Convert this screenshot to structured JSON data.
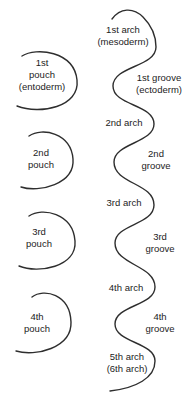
{
  "diagram": {
    "title_semantic": "Pharyngeal pouches, arches and grooves schematic",
    "background_color": "#ffffff",
    "stroke_color": "#2e2e2e",
    "text_color": "#1c1c1c",
    "pouches": [
      {
        "label": "1st\npouch\n(entoderm)"
      },
      {
        "label": "2nd\npouch"
      },
      {
        "label": "3rd\npouch"
      },
      {
        "label": "4th\npouch"
      }
    ],
    "arches": [
      {
        "label": "1st arch\n(mesoderm)"
      },
      {
        "label": "2nd arch"
      },
      {
        "label": "3rd arch"
      },
      {
        "label": "4th arch"
      },
      {
        "label": "5th arch\n(6th arch)"
      }
    ],
    "grooves": [
      {
        "label": "1st groove\n(ectoderm)"
      },
      {
        "label": "2nd groove"
      },
      {
        "label": "3rd groove"
      },
      {
        "label": "4th groove"
      }
    ]
  }
}
